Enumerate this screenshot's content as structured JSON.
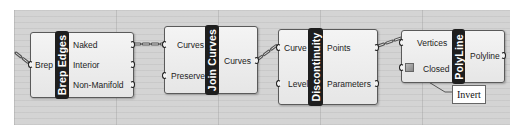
{
  "canvas": {
    "background": "#d4d4d4"
  },
  "nodes": [
    {
      "id": "brep-edges",
      "title": "Brep Edges",
      "inputs": [
        "Brep"
      ],
      "outputs": [
        "Naked",
        "Interior",
        "Non-Manifold"
      ]
    },
    {
      "id": "join-curves",
      "title": "Join Curves",
      "inputs": [
        "Curves",
        "Preserve"
      ],
      "outputs": [
        "Curves"
      ]
    },
    {
      "id": "discontinuity",
      "title": "Discontinuity",
      "inputs": [
        "Curve",
        "Level"
      ],
      "outputs": [
        "Points",
        "Parameters"
      ]
    },
    {
      "id": "polyline",
      "title": "PolyLine",
      "inputs": [
        "Vertices",
        "Closed"
      ],
      "outputs": [
        "Polyline"
      ]
    }
  ],
  "connections": [
    {
      "from": "external",
      "to": "Brep Edges.Brep"
    },
    {
      "from": "Brep Edges.Naked",
      "to": "Join Curves.Curves"
    },
    {
      "from": "Join Curves.Curves",
      "to": "Discontinuity.Curve"
    },
    {
      "from": "Discontinuity.Points",
      "to": "PolyLine.Vertices"
    }
  ],
  "tooltip": {
    "label": "Invert",
    "target": "PolyLine.Closed"
  }
}
